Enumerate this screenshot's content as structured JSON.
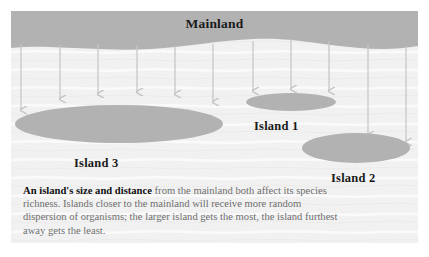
{
  "figure": {
    "type": "island-biogeography-diagram",
    "background_color": "#ffffff",
    "water_color": "#f2f2f2",
    "land_color": "#b2b2b2",
    "arrow_color": "#c4c4c4",
    "label_color": "#1a1a1a",
    "caption_color": "#6f6f6f"
  },
  "labels": {
    "mainland": "Mainland",
    "island1": "Island 1",
    "island2": "Island 2",
    "island3": "Island 3"
  },
  "caption": {
    "lead": "An island's size and distance",
    "rest": " from the mainland both affect its species richness. Islands closer to the mainland will receive more random dispersion of organisms; the larger island gets the most, the island furthest away gets the least."
  },
  "landmasses": [
    {
      "name": "Mainland",
      "shape": "wavy-band",
      "top": 0,
      "bottom_wave_min": 27,
      "bottom_wave_max": 38
    },
    {
      "name": "Island 3",
      "shape": "ellipse",
      "cx": 108,
      "cy": 113,
      "rx": 104,
      "ry": 19,
      "size_rank": "largest",
      "distance_rank": "closest"
    },
    {
      "name": "Island 1",
      "shape": "ellipse",
      "cx": 280,
      "cy": 91,
      "rx": 45,
      "ry": 9,
      "size_rank": "smallest",
      "distance_rank": "closest"
    },
    {
      "name": "Island 2",
      "shape": "ellipse",
      "cx": 345,
      "cy": 137,
      "rx": 54,
      "ry": 15,
      "size_rank": "medium",
      "distance_rank": "furthest"
    }
  ],
  "arrows": {
    "count": 11,
    "direction": "downward",
    "meaning": "random dispersal of organisms from mainland to islands",
    "items": [
      {
        "x": 10,
        "y_start": 32,
        "y_end": 99
      },
      {
        "x": 49,
        "y_start": 31,
        "y_end": 88
      },
      {
        "x": 87,
        "y_start": 30,
        "y_end": 83
      },
      {
        "x": 126,
        "y_start": 30,
        "y_end": 81
      },
      {
        "x": 164,
        "y_start": 30,
        "y_end": 83
      },
      {
        "x": 202,
        "y_start": 31,
        "y_end": 91
      },
      {
        "x": 242,
        "y_start": 31,
        "y_end": 80
      },
      {
        "x": 280,
        "y_start": 30,
        "y_end": 78
      },
      {
        "x": 318,
        "y_start": 31,
        "y_end": 80
      },
      {
        "x": 357,
        "y_start": 32,
        "y_end": 124
      },
      {
        "x": 395,
        "y_start": 33,
        "y_end": 131
      }
    ]
  }
}
